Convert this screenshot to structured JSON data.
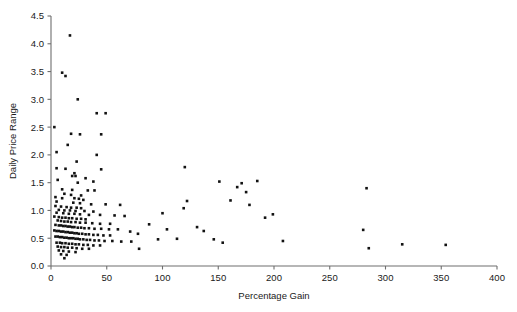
{
  "chart_data": {
    "type": "scatter",
    "title": "",
    "xlabel": "Percentage Gain",
    "ylabel": "Daily Price Range",
    "xlim": [
      0,
      400
    ],
    "ylim": [
      0.0,
      4.5
    ],
    "xticks": [
      0,
      50,
      100,
      150,
      200,
      250,
      300,
      350,
      400
    ],
    "xticklabels": [
      "0",
      "50",
      "100",
      "150",
      "200",
      "250",
      "300",
      "350",
      "400"
    ],
    "yticks": [
      0.0,
      0.5,
      1.0,
      1.5,
      2.0,
      2.5,
      3.0,
      3.5,
      4.0,
      4.5
    ],
    "yticklabels": [
      "0.0",
      "0.5",
      "1.0",
      "1.5",
      "2.0",
      "2.5",
      "3.0",
      "3.5",
      "4.0",
      "4.5"
    ],
    "grid": false,
    "legend": null,
    "marker": "square",
    "marker_size": 2.6,
    "marker_color": "#121212",
    "n_points": 191,
    "points": [
      [
        17,
        4.15
      ],
      [
        10,
        3.48
      ],
      [
        13,
        3.42
      ],
      [
        24,
        3.0
      ],
      [
        41,
        2.75
      ],
      [
        49,
        2.75
      ],
      [
        3,
        2.5
      ],
      [
        18,
        2.38
      ],
      [
        26,
        2.37
      ],
      [
        45,
        2.37
      ],
      [
        15,
        2.18
      ],
      [
        5,
        2.05
      ],
      [
        41,
        2.0
      ],
      [
        23,
        1.88
      ],
      [
        5,
        1.76
      ],
      [
        13,
        1.75
      ],
      [
        45,
        1.74
      ],
      [
        21,
        1.67
      ],
      [
        19,
        1.62
      ],
      [
        22,
        1.62
      ],
      [
        31,
        1.58
      ],
      [
        6,
        1.55
      ],
      [
        38,
        1.52
      ],
      [
        120,
        1.78
      ],
      [
        24,
        1.5
      ],
      [
        10,
        1.38
      ],
      [
        19,
        1.37
      ],
      [
        33,
        1.36
      ],
      [
        39,
        1.36
      ],
      [
        12,
        1.3
      ],
      [
        18,
        1.28
      ],
      [
        27,
        1.27
      ],
      [
        4,
        1.24
      ],
      [
        10,
        1.22
      ],
      [
        21,
        1.22
      ],
      [
        25,
        1.21
      ],
      [
        29,
        1.19
      ],
      [
        5,
        1.16
      ],
      [
        20,
        1.14
      ],
      [
        26,
        1.13
      ],
      [
        36,
        1.11
      ],
      [
        49,
        1.11
      ],
      [
        62,
        1.1
      ],
      [
        4,
        1.08
      ],
      [
        9,
        1.07
      ],
      [
        14,
        1.06
      ],
      [
        18,
        1.05
      ],
      [
        23,
        1.05
      ],
      [
        27,
        1.04
      ],
      [
        7,
        1.01
      ],
      [
        12,
        1.0
      ],
      [
        17,
        1.0
      ],
      [
        22,
        0.99
      ],
      [
        30,
        0.99
      ],
      [
        38,
        0.98
      ],
      [
        5,
        0.96
      ],
      [
        11,
        0.95
      ],
      [
        16,
        0.94
      ],
      [
        21,
        0.94
      ],
      [
        26,
        0.93
      ],
      [
        34,
        0.92
      ],
      [
        44,
        0.92
      ],
      [
        57,
        0.91
      ],
      [
        3,
        0.89
      ],
      [
        7,
        0.88
      ],
      [
        10,
        0.87
      ],
      [
        13,
        0.87
      ],
      [
        16,
        0.86
      ],
      [
        19,
        0.86
      ],
      [
        23,
        0.85
      ],
      [
        27,
        0.85
      ],
      [
        31,
        0.84
      ],
      [
        6,
        0.82
      ],
      [
        9,
        0.81
      ],
      [
        12,
        0.8
      ],
      [
        15,
        0.8
      ],
      [
        18,
        0.79
      ],
      [
        22,
        0.79
      ],
      [
        26,
        0.78
      ],
      [
        31,
        0.78
      ],
      [
        37,
        0.77
      ],
      [
        44,
        0.76
      ],
      [
        53,
        0.76
      ],
      [
        4,
        0.74
      ],
      [
        7,
        0.73
      ],
      [
        9,
        0.73
      ],
      [
        11,
        0.72
      ],
      [
        13,
        0.72
      ],
      [
        15,
        0.71
      ],
      [
        17,
        0.71
      ],
      [
        19,
        0.7
      ],
      [
        21,
        0.7
      ],
      [
        24,
        0.69
      ],
      [
        27,
        0.69
      ],
      [
        30,
        0.68
      ],
      [
        34,
        0.68
      ],
      [
        39,
        0.67
      ],
      [
        45,
        0.67
      ],
      [
        52,
        0.66
      ],
      [
        60,
        0.66
      ],
      [
        3,
        0.64
      ],
      [
        5,
        0.63
      ],
      [
        7,
        0.63
      ],
      [
        9,
        0.62
      ],
      [
        11,
        0.62
      ],
      [
        13,
        0.61
      ],
      [
        15,
        0.61
      ],
      [
        17,
        0.6
      ],
      [
        19,
        0.6
      ],
      [
        21,
        0.59
      ],
      [
        23,
        0.59
      ],
      [
        25,
        0.58
      ],
      [
        28,
        0.58
      ],
      [
        31,
        0.57
      ],
      [
        34,
        0.57
      ],
      [
        38,
        0.56
      ],
      [
        42,
        0.56
      ],
      [
        47,
        0.55
      ],
      [
        53,
        0.55
      ],
      [
        4,
        0.53
      ],
      [
        6,
        0.53
      ],
      [
        8,
        0.52
      ],
      [
        10,
        0.52
      ],
      [
        12,
        0.51
      ],
      [
        14,
        0.51
      ],
      [
        16,
        0.5
      ],
      [
        18,
        0.5
      ],
      [
        20,
        0.5
      ],
      [
        22,
        0.49
      ],
      [
        24,
        0.49
      ],
      [
        26,
        0.48
      ],
      [
        29,
        0.48
      ],
      [
        32,
        0.47
      ],
      [
        35,
        0.47
      ],
      [
        39,
        0.46
      ],
      [
        43,
        0.46
      ],
      [
        48,
        0.45
      ],
      [
        55,
        0.45
      ],
      [
        63,
        0.44
      ],
      [
        72,
        0.44
      ],
      [
        5,
        0.42
      ],
      [
        8,
        0.42
      ],
      [
        10,
        0.41
      ],
      [
        13,
        0.41
      ],
      [
        16,
        0.4
      ],
      [
        19,
        0.4
      ],
      [
        22,
        0.39
      ],
      [
        25,
        0.39
      ],
      [
        29,
        0.38
      ],
      [
        33,
        0.38
      ],
      [
        38,
        0.37
      ],
      [
        44,
        0.37
      ],
      [
        6,
        0.35
      ],
      [
        9,
        0.34
      ],
      [
        12,
        0.34
      ],
      [
        15,
        0.33
      ],
      [
        19,
        0.33
      ],
      [
        23,
        0.32
      ],
      [
        28,
        0.31
      ],
      [
        34,
        0.31
      ],
      [
        7,
        0.28
      ],
      [
        11,
        0.27
      ],
      [
        16,
        0.26
      ],
      [
        22,
        0.25
      ],
      [
        9,
        0.21
      ],
      [
        14,
        0.2
      ],
      [
        12,
        0.14
      ],
      [
        66,
        0.9
      ],
      [
        71,
        0.62
      ],
      [
        78,
        0.58
      ],
      [
        79,
        0.31
      ],
      [
        88,
        0.75
      ],
      [
        96,
        0.48
      ],
      [
        100,
        0.95
      ],
      [
        104,
        0.66
      ],
      [
        113,
        0.49
      ],
      [
        119,
        1.04
      ],
      [
        122,
        1.17
      ],
      [
        131,
        0.7
      ],
      [
        137,
        0.63
      ],
      [
        146,
        0.48
      ],
      [
        151,
        1.52
      ],
      [
        154,
        0.42
      ],
      [
        161,
        1.18
      ],
      [
        167,
        1.42
      ],
      [
        171,
        1.49
      ],
      [
        175,
        1.33
      ],
      [
        178,
        1.1
      ],
      [
        185,
        1.53
      ],
      [
        192,
        0.87
      ],
      [
        199,
        0.93
      ],
      [
        208,
        0.45
      ],
      [
        283,
        1.4
      ],
      [
        280,
        0.65
      ],
      [
        285,
        0.32
      ],
      [
        315,
        0.39
      ],
      [
        354,
        0.38
      ]
    ]
  },
  "layout": {
    "plot_left_px": 51,
    "plot_bottom_px": 266,
    "plot_right_px": 497,
    "plot_top_px": 16,
    "px_per_x": 1.115,
    "px_per_y": 55.556
  }
}
